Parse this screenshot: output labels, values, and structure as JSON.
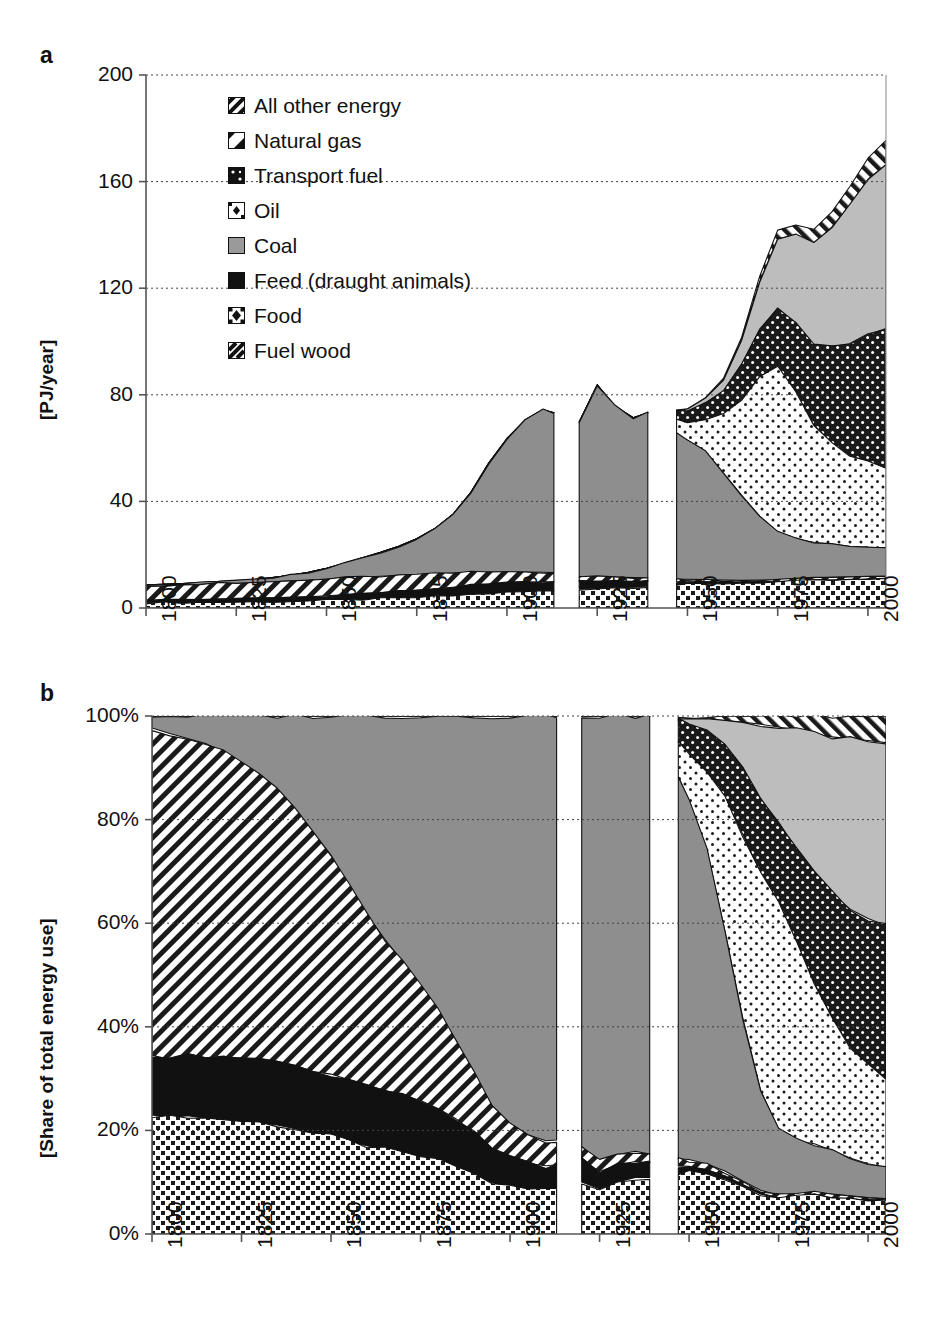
{
  "figure": {
    "panel_a_letter": "a",
    "panel_b_letter": "b"
  },
  "legend": {
    "items": [
      {
        "label": "All other energy",
        "swatch": "diagonal-hatch-dark",
        "key": "other"
      },
      {
        "label": "Natural gas",
        "swatch": "light-gray-solid",
        "key": "gas"
      },
      {
        "label": "Transport fuel",
        "swatch": "dark-dotted",
        "key": "transport"
      },
      {
        "label": "Oil",
        "swatch": "light-dotted",
        "key": "oil"
      },
      {
        "label": "Coal",
        "swatch": "gray-solid",
        "key": "coal"
      },
      {
        "label": "Feed (draught animals)",
        "swatch": "black-solid",
        "key": "feed"
      },
      {
        "label": "Food",
        "swatch": "medium-dotted",
        "key": "food"
      },
      {
        "label": "Fuel wood",
        "swatch": "diagonal-hatch",
        "key": "wood"
      }
    ]
  },
  "chart_data": [
    {
      "id": "panel-a",
      "type": "area",
      "title": "a",
      "stacked": true,
      "xlabel": "",
      "ylabel": "[PJ/year]",
      "xlim": [
        1800,
        2005
      ],
      "ylim": [
        0,
        200
      ],
      "ytick_labels": [
        "200",
        "160",
        "120",
        "80",
        "40",
        "0"
      ],
      "ytick_values": [
        200,
        160,
        120,
        80,
        40,
        0
      ],
      "xtick_labels": [
        "1800",
        "1825",
        "1850",
        "1875",
        "1900",
        "1925",
        "1950",
        "1975",
        "2000"
      ],
      "xtick_values": [
        1800,
        1825,
        1850,
        1875,
        1900,
        1925,
        1950,
        1975,
        2000
      ],
      "grid": "horizontal-dotted",
      "data_gaps": [
        [
          1913,
          1920
        ],
        [
          1939,
          1947
        ]
      ],
      "stack_order_bottom_to_top": [
        "food",
        "feed",
        "wood",
        "coal",
        "oil",
        "transport",
        "gas",
        "other"
      ],
      "x": [
        1800,
        1805,
        1810,
        1815,
        1820,
        1825,
        1830,
        1835,
        1840,
        1845,
        1850,
        1855,
        1860,
        1865,
        1870,
        1875,
        1880,
        1885,
        1890,
        1895,
        1900,
        1905,
        1910,
        1913,
        1920,
        1925,
        1930,
        1935,
        1939,
        1947,
        1950,
        1955,
        1960,
        1965,
        1970,
        1975,
        1980,
        1985,
        1990,
        1995,
        2000,
        2005
      ],
      "series": [
        {
          "name": "Food",
          "key": "food",
          "values": [
            2.0,
            2.0,
            2.1,
            2.1,
            2.2,
            2.2,
            2.3,
            2.4,
            2.5,
            2.6,
            2.8,
            3.0,
            3.2,
            3.4,
            3.6,
            3.9,
            4.2,
            4.6,
            5.0,
            5.4,
            5.8,
            6.1,
            6.4,
            6.5,
            7.0,
            7.3,
            7.6,
            7.8,
            8.0,
            8.6,
            8.8,
            9.0,
            9.2,
            9.4,
            9.6,
            9.8,
            10.0,
            10.2,
            10.4,
            10.5,
            10.6,
            10.7
          ]
        },
        {
          "name": "Feed (draught animals)",
          "key": "feed",
          "values": [
            1.0,
            1.0,
            1.1,
            1.1,
            1.2,
            1.2,
            1.3,
            1.4,
            1.5,
            1.6,
            1.8,
            2.0,
            2.2,
            2.4,
            2.6,
            2.8,
            3.0,
            3.2,
            3.4,
            3.5,
            3.6,
            3.5,
            3.4,
            3.3,
            3.0,
            2.8,
            2.5,
            2.2,
            2.0,
            1.2,
            1.0,
            0.8,
            0.5,
            0.3,
            0.2,
            0.1,
            0.1,
            0.1,
            0.1,
            0.1,
            0.1,
            0.1
          ]
        },
        {
          "name": "Fuel wood",
          "key": "wood",
          "values": [
            5.5,
            5.6,
            5.6,
            5.7,
            5.8,
            5.8,
            5.9,
            6.0,
            6.1,
            6.2,
            6.3,
            6.3,
            6.2,
            6.1,
            6.0,
            5.8,
            5.6,
            5.3,
            5.0,
            4.6,
            4.2,
            3.9,
            3.6,
            3.5,
            1.8,
            1.6,
            1.5,
            1.4,
            1.3,
            1.0,
            1.0,
            0.9,
            0.8,
            0.7,
            0.7,
            0.7,
            0.8,
            0.9,
            1.0,
            1.1,
            1.2,
            1.2
          ]
        },
        {
          "name": "Coal",
          "key": "coal",
          "values": [
            0.2,
            0.3,
            0.4,
            0.5,
            0.7,
            0.9,
            1.2,
            1.6,
            2.2,
            3.0,
            4.0,
            5.5,
            7.2,
            9.0,
            11.0,
            13.5,
            17.0,
            22.0,
            30.0,
            41.0,
            50.0,
            57.0,
            61.0,
            60.0,
            58.0,
            72.0,
            64.0,
            60.0,
            62.0,
            55.0,
            52.0,
            48.0,
            40.0,
            32.0,
            24.0,
            18.0,
            15.0,
            13.5,
            12.5,
            11.5,
            11.0,
            10.5
          ]
        },
        {
          "name": "Oil",
          "key": "oil",
          "values": [
            0,
            0,
            0,
            0,
            0,
            0,
            0,
            0,
            0,
            0,
            0,
            0,
            0,
            0,
            0,
            0,
            0,
            0,
            0,
            0,
            0,
            0,
            0,
            0,
            0,
            0,
            0,
            0,
            0,
            5.0,
            7.0,
            12.0,
            22.0,
            36.0,
            52.0,
            62.0,
            55.0,
            44.0,
            38.0,
            34.0,
            32.0,
            30.0
          ]
        },
        {
          "name": "Transport fuel",
          "key": "transport",
          "values": [
            0,
            0,
            0,
            0,
            0,
            0,
            0,
            0,
            0,
            0,
            0,
            0,
            0,
            0,
            0,
            0,
            0,
            0,
            0,
            0,
            0,
            0,
            0,
            0,
            0,
            0,
            0,
            0,
            0,
            3.0,
            4.0,
            6.0,
            9.0,
            13.0,
            18.0,
            22.0,
            26.0,
            30.0,
            36.0,
            42.0,
            48.0,
            52.0
          ]
        },
        {
          "name": "Natural gas",
          "key": "gas",
          "values": [
            0,
            0,
            0,
            0,
            0,
            0,
            0,
            0,
            0,
            0,
            0,
            0,
            0,
            0,
            0,
            0,
            0,
            0,
            0,
            0,
            0,
            0,
            0,
            0,
            0,
            0,
            0,
            0,
            0,
            0.5,
            1.0,
            2.0,
            4.0,
            9.0,
            18.0,
            26.0,
            33.0,
            38.0,
            45.0,
            52.0,
            58.0,
            62.0
          ]
        },
        {
          "name": "All other energy",
          "key": "other",
          "values": [
            0,
            0,
            0,
            0,
            0,
            0,
            0,
            0,
            0,
            0,
            0,
            0,
            0,
            0,
            0,
            0,
            0,
            0,
            0,
            0,
            0,
            0,
            0,
            0,
            0,
            0,
            0,
            0,
            0,
            0.2,
            0.3,
            0.5,
            0.8,
            1.2,
            2.0,
            3.0,
            4.0,
            5.0,
            6.0,
            7.0,
            8.0,
            9.0
          ]
        }
      ]
    },
    {
      "id": "panel-b",
      "type": "area",
      "title": "b",
      "stacked": true,
      "normalized": true,
      "xlabel": "",
      "ylabel": "[Share of total energy use]",
      "xlim": [
        1800,
        2005
      ],
      "ylim": [
        0,
        100
      ],
      "ytick_labels": [
        "100%",
        "80%",
        "60%",
        "40%",
        "20%",
        "0%"
      ],
      "ytick_values": [
        100,
        80,
        60,
        40,
        20,
        0
      ],
      "xtick_labels": [
        "1800",
        "1825",
        "1850",
        "1875",
        "1900",
        "1925",
        "1950",
        "1975",
        "2000"
      ],
      "xtick_values": [
        1800,
        1825,
        1850,
        1875,
        1900,
        1925,
        1950,
        1975,
        2000
      ],
      "grid": "horizontal-dotted",
      "data_gaps": [
        [
          1913,
          1920
        ],
        [
          1939,
          1947
        ]
      ],
      "note": "Shares are the panel-a series normalised to 100% of total energy use each year."
    }
  ]
}
